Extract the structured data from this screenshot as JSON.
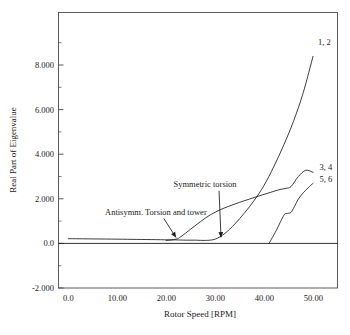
{
  "chart_data": {
    "type": "line",
    "title": "",
    "xlabel": "Rotor Speed [RPM]",
    "ylabel": "Real Part of Eigenvalue",
    "xlim": [
      -2.0,
      55.0
    ],
    "ylim": [
      -2.0,
      9.0
    ],
    "xticks": [
      0.0,
      10.0,
      20.0,
      30.0,
      40.0,
      50.0
    ],
    "xticklabels": [
      "0.0",
      "10.00",
      "20.00",
      "30.00",
      "40.00",
      "50.00"
    ],
    "yticks": [
      -2.0,
      0.0,
      2.0,
      4.0,
      6.0,
      8.0
    ],
    "yticklabels": [
      "-2.000",
      "0.0",
      "2.000",
      "4.000",
      "6.000",
      "8.000"
    ],
    "grid": false,
    "legend_position": "inline-right-labels",
    "series": [
      {
        "name": "1, 2",
        "label": "1, 2",
        "x": [
          0.0,
          5.0,
          10.0,
          14.0,
          18.0,
          21.0,
          22.0,
          24.0,
          26.0,
          28.0,
          30.0,
          32.0,
          34.0,
          36.0,
          38.0,
          40.0,
          42.0,
          44.0,
          46.0,
          48.0,
          50.0
        ],
        "y": [
          -0.03,
          -0.04,
          -0.05,
          -0.06,
          -0.07,
          -0.08,
          -0.08,
          -0.09,
          -0.09,
          -0.1,
          -0.05,
          0.18,
          0.55,
          1.0,
          1.5,
          2.1,
          2.85,
          3.7,
          4.65,
          5.8,
          7.25
        ]
      },
      {
        "name": "3, 4",
        "label": "3, 4",
        "x": [
          20.0,
          22.0,
          23.0,
          25.0,
          27.0,
          29.0,
          31.0,
          33.0,
          35.0,
          37.0,
          39.0,
          41.0,
          43.0,
          44.5,
          45.5,
          47.0,
          48.5,
          50.0
        ],
        "y": [
          -0.1,
          -0.05,
          0.05,
          0.35,
          0.65,
          0.92,
          1.12,
          1.28,
          1.42,
          1.55,
          1.68,
          1.8,
          1.92,
          1.98,
          2.05,
          2.45,
          2.7,
          2.62
        ]
      },
      {
        "name": "5, 6",
        "label": "5, 6",
        "x": [
          41.0,
          41.5,
          42.5,
          43.5,
          44.2,
          44.8,
          45.5,
          46.2,
          47.0,
          48.0,
          49.0,
          50.0
        ],
        "y": [
          -0.22,
          -0.05,
          0.3,
          0.7,
          0.95,
          0.98,
          1.02,
          1.25,
          1.55,
          1.8,
          2.0,
          2.18
        ]
      }
    ],
    "annotations": [
      {
        "text": "Antisymm. Torsion and tower",
        "text_x": 7.5,
        "text_y": 0.92,
        "arrow_from_x": 19.5,
        "arrow_from_y": 0.78,
        "arrow_to_x": 22.0,
        "arrow_to_y": 0.02
      },
      {
        "text": "Symmetric torsion",
        "text_x": 21.5,
        "text_y": 2.05,
        "arrow_from_x": 30.8,
        "arrow_from_y": 1.88,
        "arrow_to_x": 31.2,
        "arrow_to_y": 0.02
      }
    ],
    "mode_labels": [
      {
        "text": "1, 2",
        "x": 51.0,
        "y": 7.72
      },
      {
        "text": "3, 4",
        "x": 51.3,
        "y": 2.72
      },
      {
        "text": "5, 6",
        "x": 51.3,
        "y": 2.25
      }
    ],
    "colors": {
      "curve": "#1a1a1a",
      "axis": "#4a4a4a",
      "background": "#ffffff",
      "text": "#1a1a1a"
    }
  },
  "figure": {
    "x_axis_title": "Rotor Speed [RPM]",
    "y_axis_title": "Real Part of Eigenvalue"
  }
}
